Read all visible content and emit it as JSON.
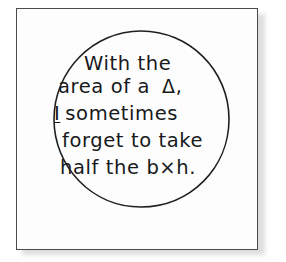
{
  "scene": {
    "description": "framed-hand-drawn-note",
    "background_color": "#ffffff",
    "paper_color": "#fdfdfd",
    "ink_color": "#17191b",
    "frame_color": "#4a4a4a",
    "shadow_color": "#d8d8d8"
  },
  "note": {
    "shape": "circle",
    "lines": [
      {
        "id": "line-1",
        "text": "With the"
      },
      {
        "id": "line-2",
        "text": "area of a"
      },
      {
        "id": "line-2-symbol",
        "text": "Δ,"
      },
      {
        "id": "line-3-emphasis",
        "text": "I"
      },
      {
        "id": "line-3",
        "text": "sometimes"
      },
      {
        "id": "line-4",
        "text": "forget to take"
      },
      {
        "id": "line-5",
        "text": "half the b×h."
      }
    ],
    "full_text": "With the area of a Δ, I sometimes forget to take half the b×h."
  }
}
